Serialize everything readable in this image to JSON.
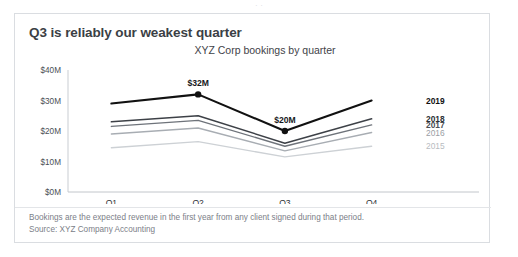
{
  "top_strip_text": "· ·",
  "card": {
    "title": "Q3 is reliably our weakest quarter",
    "footnote_line1": "Bookings are the expected revenue in the first year from any client signed during that period.",
    "footnote_line2": "Source: XYZ Company Accounting"
  },
  "chart_data": {
    "type": "line",
    "title": "XYZ Corp bookings by quarter",
    "subtitle": "XYZ Corp bookings by quarter",
    "xlabel": "",
    "ylabel": "",
    "categories": [
      "Q1",
      "Q2",
      "Q3",
      "Q4"
    ],
    "ylim": [
      0,
      40
    ],
    "ytick_labels": [
      "$0M",
      "$10M",
      "$20M",
      "$30M",
      "$40M"
    ],
    "ytick_values": [
      0,
      10,
      20,
      30,
      40
    ],
    "grid": false,
    "legend_position": "right-of-lines",
    "series": [
      {
        "name": "2019",
        "values": [
          29,
          32,
          20,
          30
        ],
        "color": "#111111",
        "width": 2.1,
        "label": "2019",
        "label_color": "#111111",
        "label_bold": true
      },
      {
        "name": "2018",
        "values": [
          23,
          25,
          16,
          24
        ],
        "color": "#3d4147",
        "width": 1.5,
        "label": "2018",
        "label_color": "#2b2f34",
        "label_bold": true
      },
      {
        "name": "2017",
        "values": [
          21.5,
          23.5,
          15,
          22
        ],
        "color": "#6e737a",
        "width": 1.4,
        "label": "2017",
        "label_color": "#4a4e54",
        "label_bold": true
      },
      {
        "name": "2016",
        "values": [
          19,
          21,
          13.5,
          19.5
        ],
        "color": "#a8adb3",
        "width": 1.4,
        "label": "2016",
        "label_color": "#9a9ea4",
        "label_bold": false
      },
      {
        "name": "2015",
        "values": [
          14.5,
          16.5,
          11.5,
          15
        ],
        "color": "#cdd1d5",
        "width": 1.4,
        "label": "2015",
        "label_color": "#b8bcc1",
        "label_bold": false
      }
    ],
    "annotations": [
      {
        "text": "$32M",
        "series": "2019",
        "category": "Q2",
        "value": 32,
        "marker": true
      },
      {
        "text": "$20M",
        "series": "2019",
        "category": "Q3",
        "value": 20,
        "marker": true
      }
    ]
  }
}
